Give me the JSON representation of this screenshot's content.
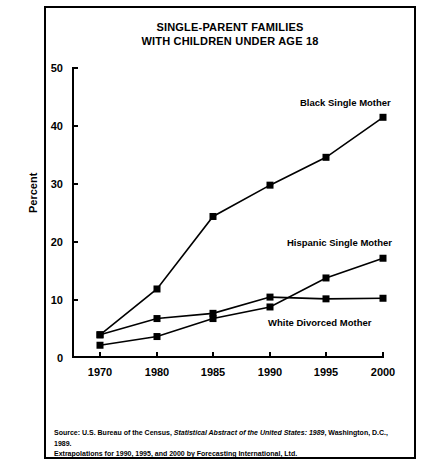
{
  "chart_data": {
    "type": "line",
    "title": "SINGLE-PARENT FAMILIES WITH CHILDREN UNDER AGE 18",
    "title_line1": "SINGLE-PARENT FAMILIES",
    "title_line2": "WITH CHILDREN UNDER AGE 18",
    "xlabel": "",
    "ylabel": "Percent",
    "categories": [
      "1970",
      "1980",
      "1985",
      "1990",
      "1995",
      "2000"
    ],
    "ylim": [
      0,
      50
    ],
    "yticks": [
      0,
      10,
      20,
      30,
      40,
      50
    ],
    "grid": false,
    "legend_position": "inline-annotations",
    "marker": "square",
    "series": [
      {
        "name": "Black Single Mother",
        "values": [
          4.0,
          11.9,
          24.4,
          29.8,
          34.6,
          41.5
        ],
        "label": "Black Single Mother"
      },
      {
        "name": "Hispanic Single Mother",
        "values": [
          2.2,
          3.7,
          6.8,
          8.8,
          13.8,
          17.2
        ],
        "label": "Hispanic Single Mother"
      },
      {
        "name": "White Divorced Mother",
        "values": [
          4.0,
          6.8,
          7.7,
          10.5,
          10.2,
          10.3
        ],
        "label": "White Divorced Mother"
      }
    ],
    "annotations": [
      {
        "text": "Black Single Mother",
        "x": 1997,
        "y": 45.5
      },
      {
        "text": "Hispanic Single Mother",
        "x": 1996,
        "y": 21.0
      },
      {
        "text": "White Divorced Mother",
        "x": 1997,
        "y": 7.5
      }
    ],
    "colors": {
      "line": "#000000",
      "marker": "#000000",
      "background": "#ffffff",
      "axis": "#000000"
    }
  },
  "source": {
    "prefix": "Source:",
    "text_before_italic": " U.S. Bureau of the Census, ",
    "italic": "Statistical Abstract of the United States: 1989",
    "text_after_italic": ", Washington, D.C., 1989.",
    "line2": "Extrapolations for 1990, 1995, and 2000 by Forecasting International, Ltd."
  }
}
